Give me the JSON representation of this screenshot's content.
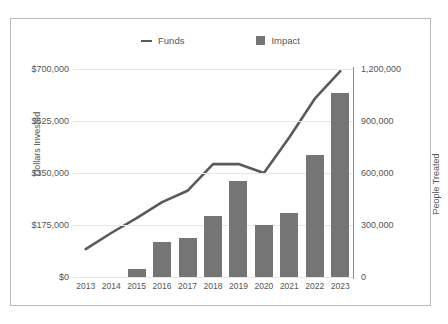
{
  "legend": {
    "items": [
      {
        "label": "Funds",
        "marker": "line-marker-icon",
        "color": "#5a5a5a"
      },
      {
        "label": "Impact",
        "marker": "square-swatch-icon",
        "color": "#757575"
      }
    ]
  },
  "axes": {
    "left_title": "Dollars Invested",
    "right_title": "People Treated",
    "left_ticks": [
      "$0",
      "$175,000",
      "$350,000",
      "$525,000",
      "$700,000"
    ],
    "right_ticks": [
      "0",
      "300,000",
      "600,000",
      "900,000",
      "1,200,000"
    ]
  },
  "chart_data": {
    "type": "bar",
    "title": "",
    "xlabel": "",
    "ylabel": "Dollars Invested",
    "y2label": "People Treated",
    "categories": [
      "2013",
      "2014",
      "2015",
      "2016",
      "2017",
      "2018",
      "2019",
      "2020",
      "2021",
      "2022",
      "2023"
    ],
    "grid": true,
    "legend_position": "top-center",
    "ylim": [
      0,
      700000
    ],
    "y2lim": [
      0,
      1200000
    ],
    "ytick_values": [
      0,
      175000,
      350000,
      525000,
      700000
    ],
    "y2tick_values": [
      0,
      300000,
      600000,
      900000,
      1200000
    ],
    "series": [
      {
        "name": "Impact",
        "type": "bar",
        "axis": "right",
        "unit": "People Treated",
        "color": "#757575",
        "values": [
          0,
          0,
          45000,
          200000,
          225000,
          350000,
          553000,
          300000,
          369000,
          703000,
          1060000
        ]
      },
      {
        "name": "Funds",
        "type": "line",
        "axis": "left",
        "unit": "Dollars Invested",
        "color": "#5a5a5a",
        "values": [
          94000,
          148000,
          198000,
          252000,
          290000,
          380000,
          380000,
          350000,
          470000,
          600000,
          693000
        ]
      }
    ]
  }
}
